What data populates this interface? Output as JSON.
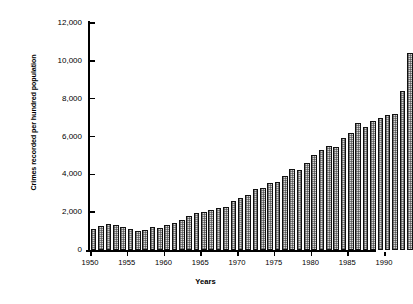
{
  "chart_data": {
    "type": "bar",
    "title": "",
    "subtitle": "",
    "xlabel": "Years",
    "ylabel": "Crimes recorded per hundred population",
    "ylim": [
      0,
      12000
    ],
    "xlim": [
      1949.4,
      1993.6
    ],
    "grid": false,
    "legend": null,
    "y_ticks": [
      0,
      2000,
      4000,
      6000,
      8000,
      10000,
      12000
    ],
    "y_tick_labels": [
      "0",
      "2,000",
      "4,000",
      "6,000",
      "8,000",
      "10,000",
      "12,000"
    ],
    "x_ticks": [
      1950,
      1955,
      1960,
      1965,
      1970,
      1975,
      1980,
      1985,
      1990
    ],
    "x_tick_labels": [
      "1950",
      "1955",
      "1960",
      "1965",
      "1970",
      "1975",
      "1980",
      "1985",
      "1990"
    ],
    "bar_style": {
      "fill": "#d6d6d6",
      "pattern": "stippled-checker",
      "edge": "#111111"
    },
    "categories": [
      1950,
      1951,
      1952,
      1953,
      1954,
      1955,
      1956,
      1957,
      1958,
      1959,
      1960,
      1961,
      1962,
      1963,
      1964,
      1965,
      1966,
      1967,
      1968,
      1969,
      1970,
      1971,
      1972,
      1973,
      1974,
      1975,
      1976,
      1977,
      1978,
      1979,
      1980,
      1981,
      1982,
      1983,
      1984,
      1985,
      1986,
      1987,
      1988,
      1989,
      1990,
      1991,
      1992,
      1993
    ],
    "values": [
      1100,
      1250,
      1400,
      1300,
      1200,
      1100,
      1000,
      1050,
      1200,
      1150,
      1300,
      1450,
      1600,
      1800,
      1950,
      2000,
      2100,
      2200,
      2300,
      2600,
      2750,
      2900,
      3250,
      3300,
      3550,
      3600,
      3900,
      4300,
      4250,
      4600,
      5000,
      5300,
      5500,
      5450,
      5900,
      6200,
      6700,
      6500,
      6800,
      7000,
      7150,
      7200,
      8400,
      10400
    ]
  }
}
